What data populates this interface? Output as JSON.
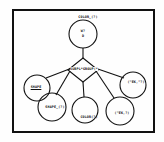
{
  "diagram": {
    "top_node": {
      "label": "COLOR_(?)",
      "inner_line1": "W?",
      "inner_line2": "D"
    },
    "relation": {
      "label": "SUBPL*GROUP(*"
    },
    "left_nodes": [
      {
        "label": "SHAPE",
        "underlined": true
      },
      {
        "label": "SHAPE_(?)"
      }
    ],
    "middle_node": {
      "label": "COLOR(?)"
    },
    "right_nodes": [
      {
        "label": "(\"EK,\"?)"
      },
      {
        "label": "(\"EK,?)"
      }
    ],
    "colors": {
      "line": "#111111",
      "background": "#fefefe"
    }
  }
}
